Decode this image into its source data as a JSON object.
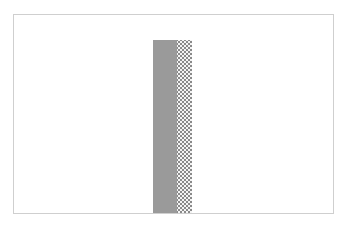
{
  "chart_data": {
    "type": "bar",
    "title": "",
    "xlabel": "",
    "ylabel": "",
    "categories": [
      ""
    ],
    "series": [
      {
        "name": "solid",
        "values": [
          0.875
        ],
        "color": "#9a9a9a",
        "pattern": "solid"
      },
      {
        "name": "dotted",
        "values": [
          0.875
        ],
        "color": "#8a8a8a",
        "pattern": "dots"
      }
    ],
    "grid": false,
    "legend": "none",
    "ylim": [
      0,
      1
    ]
  },
  "layout": {
    "frame": {
      "left": 13,
      "top": 14,
      "width": 321,
      "height": 200
    },
    "bar": {
      "left_in_frame": 139,
      "solid_width": 24,
      "dotted_width": 15,
      "height_fraction": 0.875
    }
  }
}
